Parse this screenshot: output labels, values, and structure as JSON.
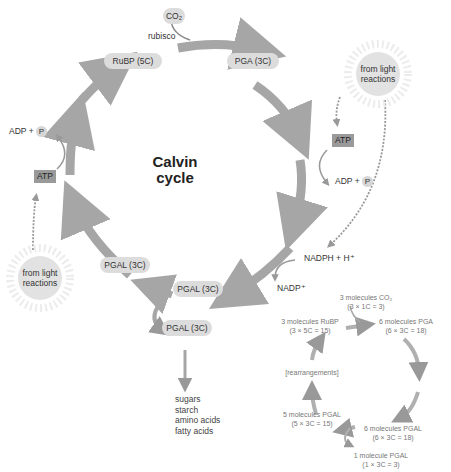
{
  "title": {
    "line1": "Calvin",
    "line2": "cycle"
  },
  "inputs": {
    "co2": "CO₂",
    "enzyme": "rubisco"
  },
  "molecules": {
    "rubp": "RuBP (5C)",
    "pga": "PGA (3C)",
    "pgal_left": "PGAL (3C)",
    "pgal_mid": "PGAL (3C)",
    "pgal_out": "PGAL (3C)"
  },
  "energy": {
    "atp_right": "ATP",
    "adp_right": "ADP +",
    "p_right": "P",
    "atp_left": "ATP",
    "adp_left": "ADP +",
    "p_left": "P",
    "nadph": "NADPH + H⁺",
    "nadp": "NADP⁺"
  },
  "sun_right": {
    "line1": "from light",
    "line2": "reactions"
  },
  "sun_left": {
    "line1": "from light",
    "line2": "reactions"
  },
  "products": [
    "sugars",
    "starch",
    "amino acids",
    "fatty acids"
  ],
  "summary": {
    "co2": {
      "line1": "3 molecules CO₂",
      "line2": "(3 × 1C = 3)"
    },
    "rubp": {
      "line1": "3 molecules RuBP",
      "line2": "(3 × 5C = 15)"
    },
    "pga": {
      "line1": "6 molecules PGA",
      "line2": "(6 × 3C = 18)"
    },
    "rearr": "[rearrangements]",
    "pgal5": {
      "line1": "5 molecules PGAL",
      "line2": "(5 × 3C = 15)"
    },
    "pgal6": {
      "line1": "6 molecules PGAL",
      "line2": "(6 × 3C = 18)"
    },
    "pgal1": {
      "line1": "1 molecule PGAL",
      "line2": "(1 × 3C = 3)"
    }
  },
  "colors": {
    "arrow": "#a6a6a6",
    "pill": "#dcdcdc",
    "box": "#9a9a9a",
    "sun": "#e2e2e2"
  }
}
